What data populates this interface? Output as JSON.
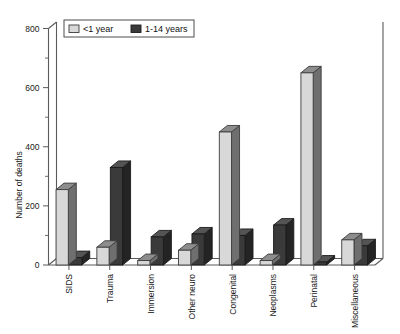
{
  "chart_data": {
    "type": "bar",
    "title": "",
    "xlabel": "",
    "ylabel": "Number of deaths",
    "ylim": [
      0,
      800
    ],
    "yticks": [
      0,
      200,
      400,
      600,
      800
    ],
    "ytick_labels": [
      "0",
      "200",
      "400",
      "600",
      "800"
    ],
    "minor_tick_step": 100,
    "grid": false,
    "legend_position": "top-left",
    "categories": [
      "SIDS",
      "Trauma",
      "Immersion",
      "Other neuro",
      "Congenital",
      "Neoplasms",
      "Perinatal",
      "Miscellaneous"
    ],
    "series": [
      {
        "name": "<1 year",
        "color": "#d8d8d8",
        "values": [
          255,
          60,
          15,
          50,
          450,
          15,
          650,
          85
        ]
      },
      {
        "name": "1-14 years",
        "color": "#3a3a3a",
        "values": [
          25,
          330,
          95,
          105,
          100,
          135,
          10,
          65
        ]
      }
    ]
  },
  "legend": {
    "entries": [
      {
        "label": "<1 year"
      },
      {
        "label": "1-14 years"
      }
    ]
  },
  "axes": {
    "y_axis_title": "Number of deaths"
  }
}
